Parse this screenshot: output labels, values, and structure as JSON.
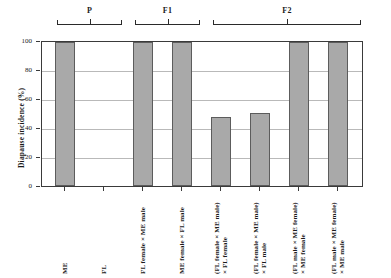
{
  "chart_data": {
    "type": "bar",
    "title": "",
    "xlabel": "",
    "ylabel": "Diapause incidence (%)",
    "ylim": [
      0,
      100
    ],
    "yticks": [
      "0",
      "20",
      "40",
      "60",
      "80",
      "100"
    ],
    "grid": true,
    "legend": "none",
    "categories": [
      "ME",
      "FL",
      "FL female × ME male",
      "ME female × FL male",
      "(FL female × ME male) × FL female",
      "(FL female × ME male) × FL male",
      "(FL male × ME female) × ME female",
      "(FL male × ME female) × ME male"
    ],
    "values": [
      100,
      0,
      100,
      100,
      48,
      51,
      100,
      100
    ],
    "bar_color": "#a9a9a9",
    "bar_edge_color": "#5c5c5c",
    "groups": [
      {
        "label": "P",
        "from": 0,
        "to": 1
      },
      {
        "label": "F1",
        "from": 2,
        "to": 3
      },
      {
        "label": "F2",
        "from": 4,
        "to": 7
      }
    ]
  },
  "xlabels": [
    {
      "line1": "ME",
      "line2": ""
    },
    {
      "line1": "FL",
      "line2": ""
    },
    {
      "line1": "FL female × ME male",
      "line2": ""
    },
    {
      "line1": "ME female × FL male",
      "line2": ""
    },
    {
      "line1": "(FL female × ME male)",
      "line2": "× FL female"
    },
    {
      "line1": "(FL female × ME male)",
      "line2": "× FL male"
    },
    {
      "line1": "(FL male × ME female)",
      "line2": "× ME female"
    },
    {
      "line1": "(FL male × ME female)",
      "line2": "× ME male"
    }
  ]
}
